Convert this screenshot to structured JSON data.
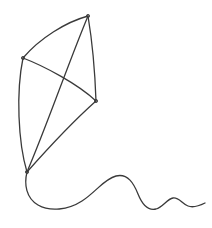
{
  "illustration": {
    "title": "Kite line drawing",
    "subject": "kite-with-tail",
    "style": "hand-drawn line art",
    "background_color": "#ffffff",
    "stroke_color": "#3a3a3a",
    "stroke_width": 1.3,
    "canvas": {
      "width": 212,
      "height": 228
    }
  },
  "kite": {
    "label": "kite body",
    "vertices": {
      "top": {
        "name": "top-vertex",
        "x": 88,
        "y": 16
      },
      "left": {
        "name": "left-vertex",
        "x": 23,
        "y": 58
      },
      "right": {
        "name": "right-vertex",
        "x": 96,
        "y": 101
      },
      "bottom": {
        "name": "bottom-vertex",
        "x": 27,
        "y": 172
      }
    },
    "edges": [
      {
        "name": "edge-top-left",
        "from": "top",
        "to": "left",
        "path": "M 88 16 C 66 22 40 38 23 58",
        "curvature": "bows outward upper-left"
      },
      {
        "name": "edge-left-bottom",
        "from": "left",
        "to": "bottom",
        "path": "M 23 58 C 16 92 18 142 27 172",
        "curvature": "bows outward left"
      },
      {
        "name": "edge-bottom-right",
        "from": "bottom",
        "to": "right",
        "path": "M 27 172 C 50 146 78 117 96 101",
        "curvature": "near straight"
      },
      {
        "name": "edge-right-top",
        "from": "right",
        "to": "top",
        "path": "M 96 101 C 95 72 92 40 88 16",
        "curvature": "near straight slight bow right"
      }
    ],
    "spars": [
      {
        "name": "spar-vertical-spine",
        "from": "top",
        "to": "bottom",
        "path": "M 88 16 C 68 64 46 128 27 172",
        "curvature": "slight"
      },
      {
        "name": "spar-horizontal-crossbar",
        "from": "left",
        "to": "right",
        "path": "M 23 58 C 44 66 78 84 96 101",
        "curvature": "dips downward"
      }
    ]
  },
  "tail": {
    "name": "kite-tail",
    "label": "wavy trailing tail",
    "starts_at": "bottom-vertex",
    "path": "M 27 172 C 24 184 26 198 38 205 C 50 212 68 210 82 201 C 96 192 104 179 116 176 C 128 173 134 184 138 194 C 142 204 148 211 156 209 C 163 207 167 199 173 198 C 179 197 182 204 188 206 C 193 208 199 206 205 203",
    "waves": 3,
    "direction": "loops down-left then travels right with decreasing amplitude"
  }
}
